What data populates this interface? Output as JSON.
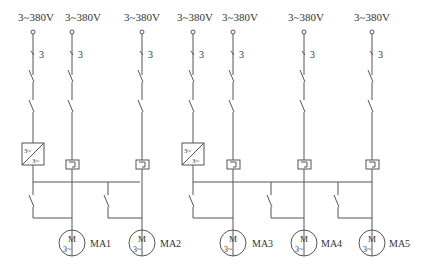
{
  "diagram": {
    "type": "electrical-circuit",
    "supply_labels": [
      "3~380V",
      "3~380V",
      "3~380V",
      "3~380V",
      "3~380V",
      "3~380V",
      "3~380V"
    ],
    "pole_count_label": "3",
    "converter_label_in": "3~",
    "converter_label_out": "3~",
    "motor_symbol": "M",
    "motor_phase": "3~",
    "motors": [
      {
        "label": "MA1"
      },
      {
        "label": "MA2"
      },
      {
        "label": "MA3"
      },
      {
        "label": "MA4"
      },
      {
        "label": "MA5"
      }
    ]
  }
}
